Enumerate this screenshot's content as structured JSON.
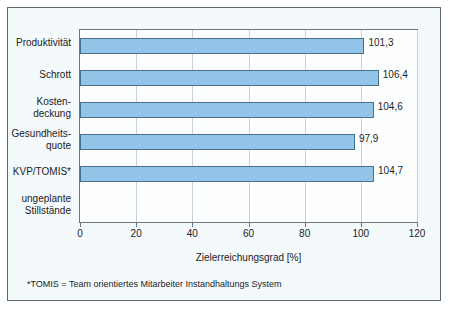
{
  "chart_data": {
    "type": "bar",
    "orientation": "horizontal",
    "title": "",
    "xlabel": "Zielerreichungsgrad [%]",
    "ylabel": "",
    "xlim": [
      0,
      120
    ],
    "xticks": [
      0,
      20,
      40,
      60,
      80,
      100,
      120
    ],
    "xtick_labels": [
      "0",
      "20",
      "40",
      "60",
      "80",
      "100",
      "120"
    ],
    "grid": "vertical",
    "legend": "none",
    "categories": [
      "Produktivität",
      "Schrott",
      "Kosten-\ndeckung",
      "Gesundheits-\nquote",
      "KVP/TOMIS*",
      "ungeplante\nStillstände"
    ],
    "category_lines": [
      [
        "Produktivität"
      ],
      [
        "Schrott"
      ],
      [
        "Kosten-",
        "deckung"
      ],
      [
        "Gesundheits-",
        "quote"
      ],
      [
        "KVP/TOMIS*"
      ],
      [
        "ungeplante",
        "Stillstände"
      ]
    ],
    "values": [
      101.3,
      106.4,
      104.6,
      97.9,
      104.7,
      null
    ],
    "value_labels": [
      "101,3",
      "106,4",
      "104,6",
      "97,9",
      "104,7",
      ""
    ],
    "bar_color": "#92c5e8",
    "bar_border_color": "#46708f",
    "annotation": "*TOMIS = Team orientiertes Mitarbeiter Instandhaltungs System"
  },
  "footnote": {
    "text": "*TOMIS  = Team orientiertes Mitarbeiter Instandhaltungs System"
  },
  "axis": {
    "x_title": "Zielerreichungsgrad [%]"
  }
}
